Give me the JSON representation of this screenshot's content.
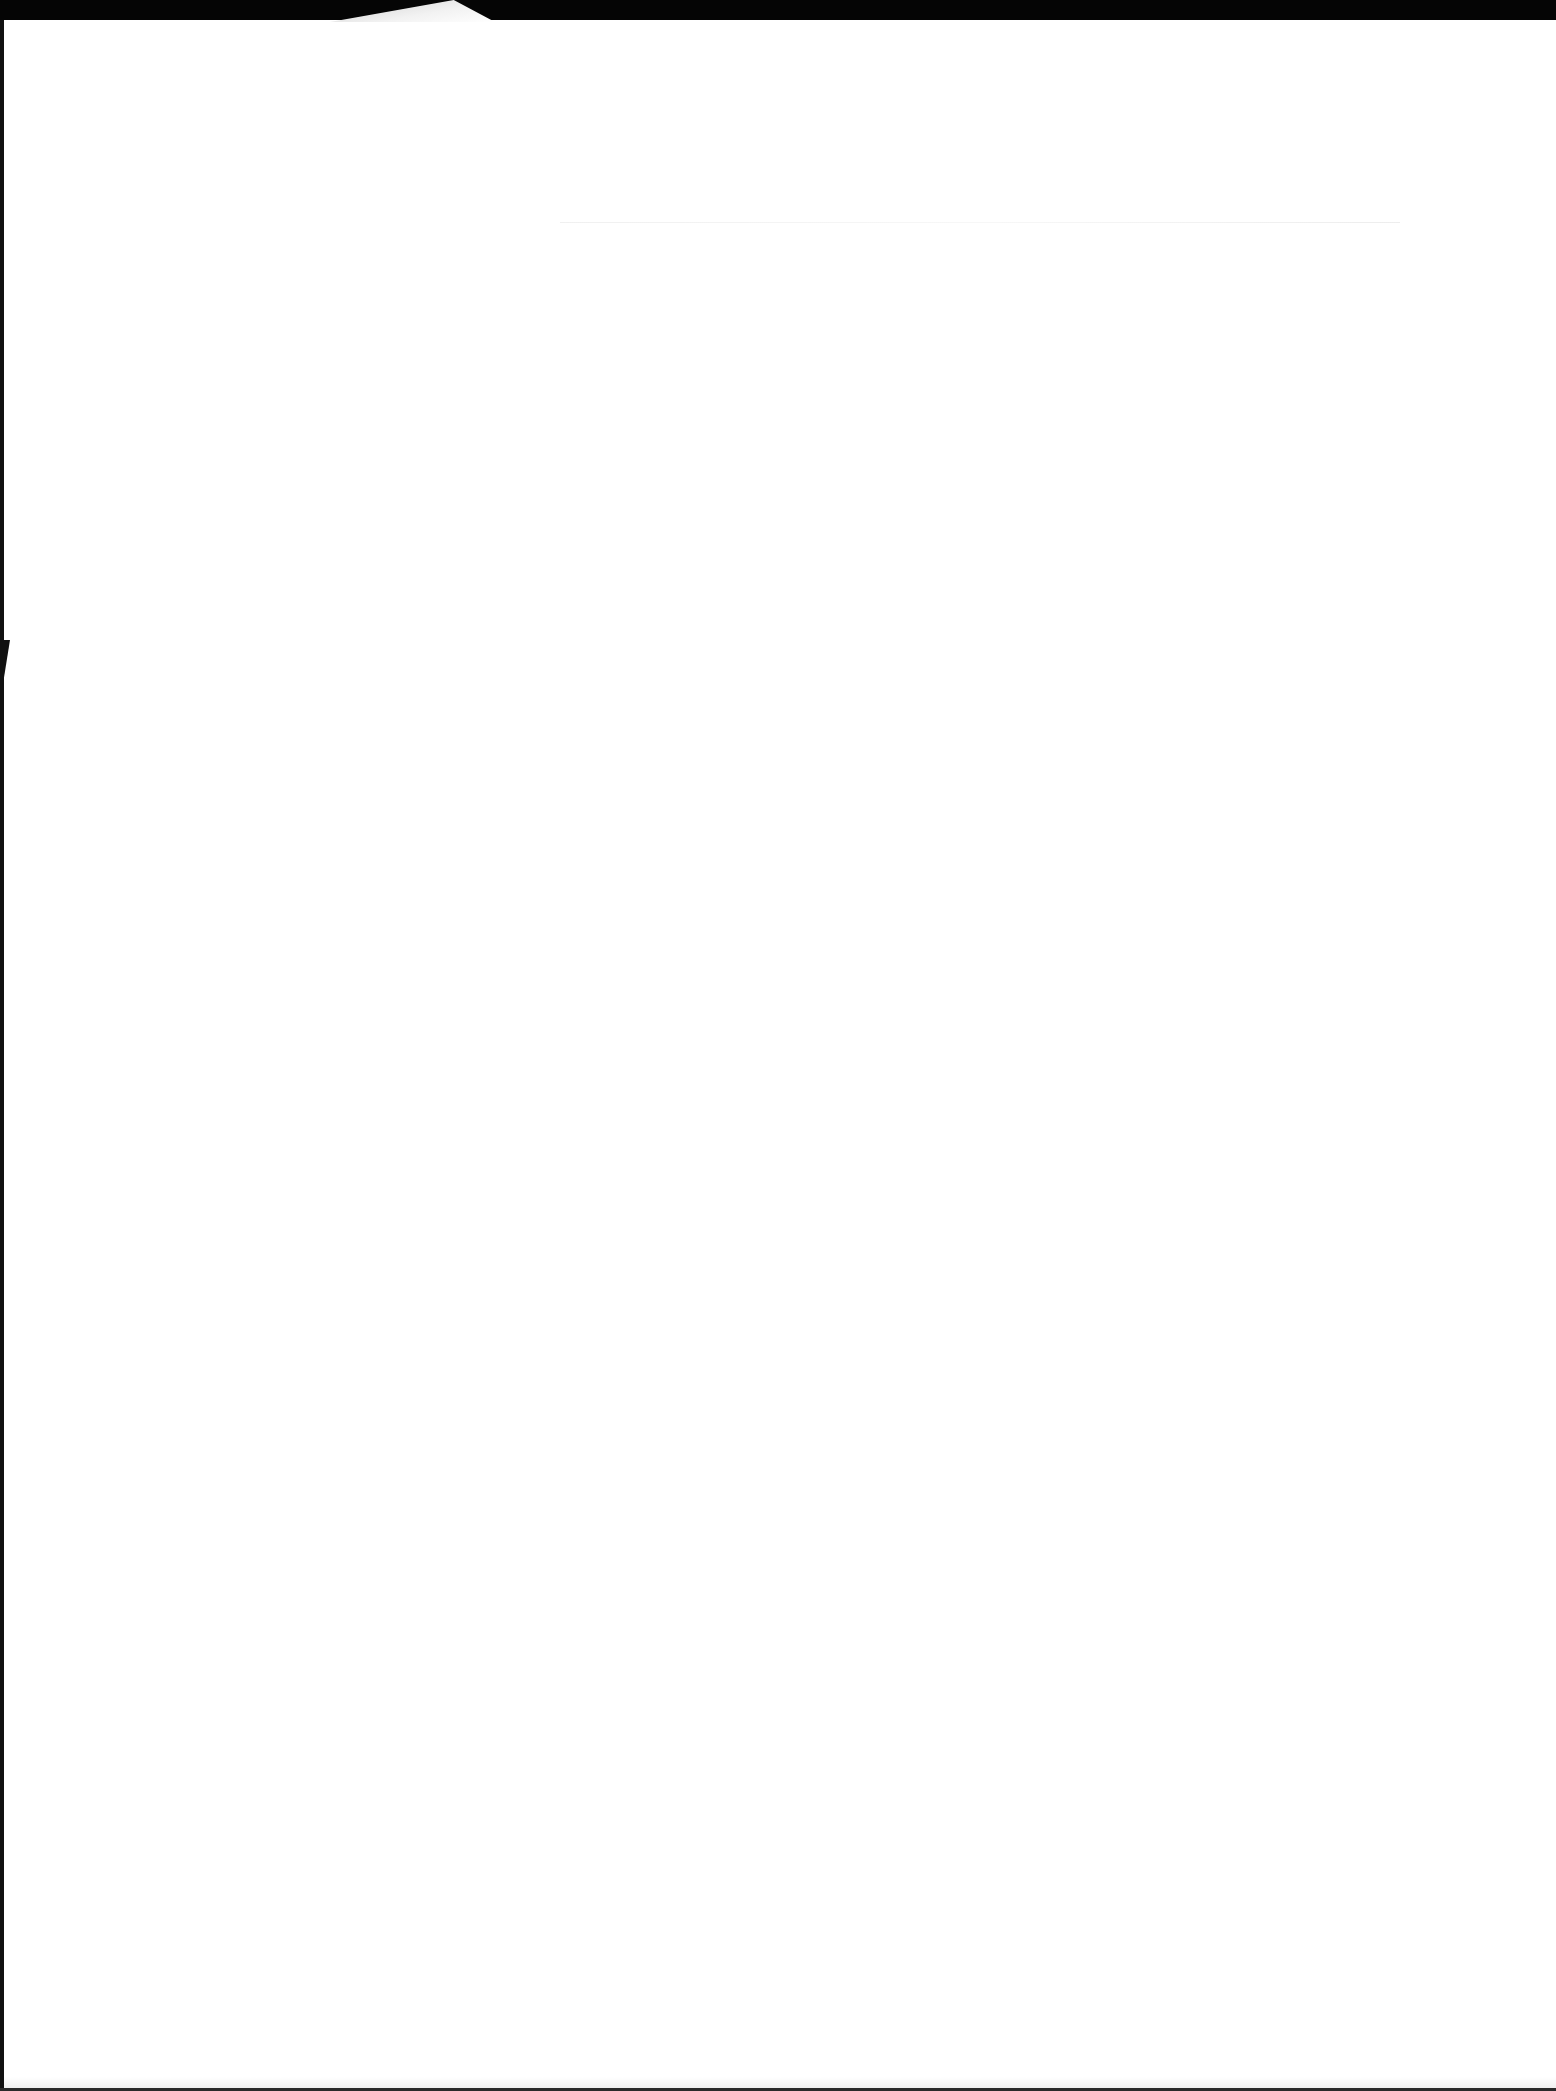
{
  "document": {
    "type": "scanned page",
    "content": "",
    "is_blank": true
  },
  "colors": {
    "paper": "#ffffff",
    "scan_border": "#0a0a0a"
  }
}
